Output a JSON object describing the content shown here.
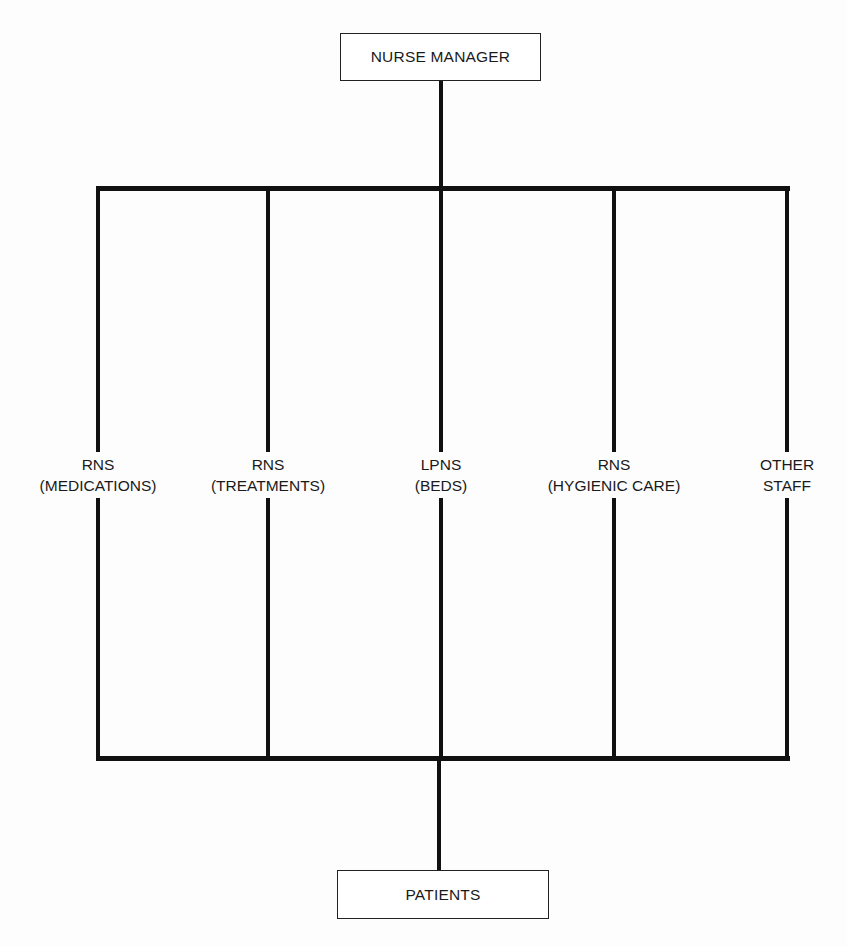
{
  "diagram": {
    "type": "organizational-chart",
    "top_node": {
      "label": "NURSE MANAGER"
    },
    "bottom_node": {
      "label": "PATIENTS"
    },
    "branches": [
      {
        "role": "RNS",
        "task": "(MEDICATIONS)"
      },
      {
        "role": "RNS",
        "task": "(TREATMENTS)"
      },
      {
        "role": "LPNS",
        "task": "(BEDS)"
      },
      {
        "role": "RNS",
        "task": "(HYGIENIC CARE)"
      },
      {
        "role": "OTHER",
        "task": "STAFF"
      }
    ]
  }
}
